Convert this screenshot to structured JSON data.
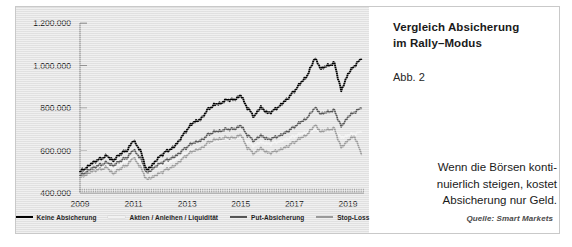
{
  "title": {
    "line1": "Vergleich Absicherung",
    "line2": "im Rally–Modus",
    "full": "Vergleich Absicherung im Rally–Modus"
  },
  "figure_number": "Abb. 2",
  "caption": "Wenn die Börsen konti–nuierlich steigen, kostet Absicherung nur Geld.",
  "caption_lines": [
    "Wenn die Börsen konti-",
    "nuierlich steigen, kostet",
    "Absicherung nur Geld."
  ],
  "source": "Quelle: Smart Markets",
  "colors": {
    "panel_background": "#e4e4e4",
    "page_background": "#ffffff",
    "frame_border": "#c9c9c9",
    "axis": "#8a8a8a",
    "keine_absicherung": "#000000",
    "aktien_anleihen_liquiditaet": "#f2f2f2",
    "put_absicherung": "#555555",
    "stop_loss": "#9a9a9a",
    "text": "#1a1a1a"
  },
  "legend": {
    "items": [
      {
        "label": "Keine Absicherung",
        "color": "#000000"
      },
      {
        "label": "Aktien / Anleihen / Liquidität",
        "color": "#f2f2f2"
      },
      {
        "label": "Put-Absicherung",
        "color": "#555555"
      },
      {
        "label": "Stop-Loss",
        "color": "#9a9a9a"
      }
    ]
  },
  "chart_data": {
    "type": "line",
    "title": "Vergleich Absicherung im Rally–Modus",
    "xlabel": "",
    "ylabel": "",
    "grid": false,
    "legend_position": "bottom",
    "xlim": [
      2009,
      2019.6
    ],
    "ylim": [
      400000,
      1200000
    ],
    "yticks": [
      400000,
      600000,
      800000,
      1000000,
      1200000
    ],
    "ytick_labels": [
      "400.000",
      "600.000",
      "800.000",
      "1.000.000",
      "1.200.000"
    ],
    "xticks": [
      2009,
      2011,
      2013,
      2015,
      2017,
      2019
    ],
    "xtick_labels": [
      "2009",
      "2011",
      "2013",
      "2015",
      "2017",
      "2019"
    ],
    "minor_tick_interval_years": 0.0833,
    "x": [
      2009.0,
      2009.25,
      2009.5,
      2009.75,
      2010.0,
      2010.25,
      2010.5,
      2010.75,
      2011.0,
      2011.25,
      2011.5,
      2011.75,
      2012.0,
      2012.25,
      2012.5,
      2012.75,
      2013.0,
      2013.25,
      2013.5,
      2013.75,
      2014.0,
      2014.25,
      2014.5,
      2014.75,
      2015.0,
      2015.25,
      2015.5,
      2015.75,
      2016.0,
      2016.25,
      2016.5,
      2016.75,
      2017.0,
      2017.25,
      2017.5,
      2017.75,
      2018.0,
      2018.25,
      2018.5,
      2018.75,
      2019.0,
      2019.25,
      2019.5
    ],
    "series": [
      {
        "name": "Keine Absicherung",
        "color": "#000000",
        "width": 1.9,
        "values": [
          500000,
          520000,
          545000,
          560000,
          575000,
          552000,
          585000,
          600000,
          648000,
          600000,
          505000,
          540000,
          575000,
          598000,
          615000,
          655000,
          700000,
          735000,
          745000,
          790000,
          815000,
          822000,
          840000,
          838000,
          860000,
          800000,
          760000,
          805000,
          775000,
          790000,
          815000,
          845000,
          880000,
          920000,
          955000,
          1035000,
          985000,
          1000000,
          1010000,
          880000,
          960000,
          1000000,
          1030000
        ]
      },
      {
        "name": "Aktien / Anleihen / Liquidität",
        "color": "#f2f2f2",
        "width": 1.6,
        "values": [
          478000,
          492000,
          510000,
          518000,
          528000,
          515000,
          538000,
          548000,
          572000,
          548000,
          492000,
          512000,
          530000,
          542000,
          552000,
          572000,
          592000,
          605000,
          612000,
          632000,
          642000,
          648000,
          655000,
          654000,
          662000,
          640000,
          622000,
          640000,
          630000,
          636000,
          645000,
          655000,
          668000,
          678000,
          686000,
          700000,
          688000,
          692000,
          696000,
          660000,
          672000,
          680000,
          686000
        ]
      },
      {
        "name": "Put-Absicherung",
        "color": "#555555",
        "width": 1.7,
        "values": [
          482000,
          500000,
          520000,
          532000,
          544000,
          528000,
          552000,
          566000,
          604000,
          566000,
          492000,
          518000,
          540000,
          556000,
          568000,
          592000,
          618000,
          638000,
          645000,
          672000,
          688000,
          692000,
          702000,
          700000,
          718000,
          672000,
          645000,
          672000,
          652000,
          660000,
          672000,
          690000,
          712000,
          735000,
          755000,
          802000,
          772000,
          782000,
          788000,
          712000,
          758000,
          782000,
          798000
        ]
      },
      {
        "name": "Stop-Loss",
        "color": "#9a9a9a",
        "width": 1.7,
        "values": [
          472000,
          488000,
          505000,
          512000,
          520000,
          490000,
          516000,
          530000,
          568000,
          522000,
          462000,
          478000,
          495000,
          512000,
          525000,
          552000,
          580000,
          600000,
          608000,
          635000,
          650000,
          655000,
          662000,
          658000,
          675000,
          612000,
          585000,
          612000,
          588000,
          594000,
          605000,
          620000,
          640000,
          660000,
          676000,
          720000,
          688000,
          698000,
          702000,
          612000,
          648000,
          668000,
          582000
        ]
      }
    ]
  }
}
